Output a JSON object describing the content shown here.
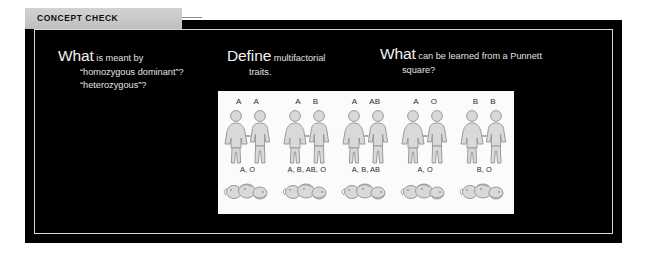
{
  "header": {
    "tab_label": "CONCEPT CHECK"
  },
  "colors": {
    "panel_background": "#000000",
    "panel_border": "#d8d8d8",
    "tab_background": "#c9c9c9",
    "text": "#e8e8e8",
    "figure_background": "#fbfbfb",
    "figure_ink": "#2b2b2b"
  },
  "questions": [
    {
      "lead": "What",
      "rest": " is meant by",
      "continuation_1": "“homozygous dominant”?",
      "continuation_2": "“heterozygous”?"
    },
    {
      "lead": "Define",
      "rest": " multifactorial",
      "continuation_1": "traits.",
      "continuation_2": ""
    },
    {
      "lead": "What",
      "rest": " can be learned from a Punnett",
      "continuation_1": "square?",
      "continuation_2": ""
    }
  ],
  "figure": {
    "caption": "Blood type inheritance chart",
    "crosses": [
      {
        "parent_left": "A",
        "parent_right": "A",
        "offspring": "A, O"
      },
      {
        "parent_left": "A",
        "parent_right": "B",
        "offspring": "A, B, AB, O"
      },
      {
        "parent_left": "A",
        "parent_right": "AB",
        "offspring": "A, B, AB"
      },
      {
        "parent_left": "A",
        "parent_right": "O",
        "offspring": "A, O"
      },
      {
        "parent_left": "B",
        "parent_right": "B",
        "offspring": "B, O"
      }
    ]
  }
}
